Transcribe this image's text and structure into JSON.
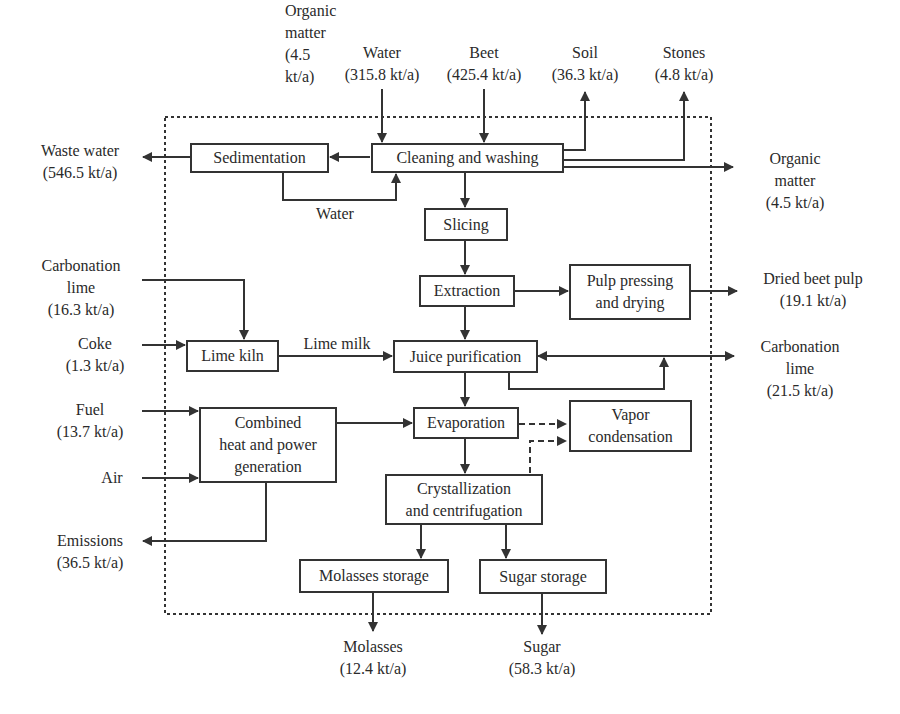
{
  "diagram": {
    "type": "process-flow",
    "boundary": "dotted system boundary",
    "units": {
      "sedimentation": "Sedimentation",
      "cleaning": "Cleaning and washing",
      "slicing": "Slicing",
      "extraction": "Extraction",
      "pulp": "Pulp pressing\nand drying",
      "lime_kiln": "Lime kiln",
      "juice": "Juice purification",
      "chp": "Combined\nheat and power\ngeneration",
      "evaporation": "Evaporation",
      "vapor": "Vapor\ncondensation",
      "crystallization": "Crystallization\nand centrifugation",
      "molasses_storage": "Molasses storage",
      "sugar_storage": "Sugar storage"
    },
    "streams": {
      "water_in": "Water\n(315.8 kt/a)",
      "beet_in": "Beet\n(425.4 kt/a)",
      "soil_out": "Soil\n(36.3 kt/a)",
      "stones_out": "Stones\n(4.8 kt/a)",
      "waste_water_out": "Waste water\n(546.5 kt/a)",
      "organic_out": "Organic\nmatter\n(4.5 kt/a)",
      "water_recycle": "Water",
      "carb_lime_in": "Carbonation\nlime\n(16.3 kt/a)",
      "coke_in": "Coke\n(1.3 kt/a)",
      "lime_milk": "Lime milk",
      "dried_pulp_out": "Dried beet pulp\n(19.1 kt/a)",
      "carb_lime_out": "Carbonation\nlime\n(21.5 kt/a)",
      "fuel_in": "Fuel\n(13.7 kt/a)",
      "air_in": "Air",
      "emissions_out": "Emissions\n(36.5 kt/a)",
      "molasses_out": "Molasses\n(12.4 kt/a)",
      "sugar_out": "Sugar\n(58.3 kt/a)"
    },
    "flows": [
      {
        "from": "Water (315.8 kt/a)",
        "to": "Cleaning and washing"
      },
      {
        "from": "Beet (425.4 kt/a)",
        "to": "Cleaning and washing"
      },
      {
        "from": "Cleaning and washing",
        "to": "Soil (36.3 kt/a)"
      },
      {
        "from": "Cleaning and washing",
        "to": "Stones (4.8 kt/a)"
      },
      {
        "from": "Cleaning and washing",
        "to": "Organic matter (4.5 kt/a)"
      },
      {
        "from": "Cleaning and washing",
        "to": "Sedimentation"
      },
      {
        "from": "Sedimentation",
        "to": "Waste water (546.5 kt/a)"
      },
      {
        "from": "Sedimentation",
        "to": "Cleaning and washing",
        "label": "Water"
      },
      {
        "from": "Cleaning and washing",
        "to": "Slicing"
      },
      {
        "from": "Slicing",
        "to": "Extraction"
      },
      {
        "from": "Extraction",
        "to": "Pulp pressing and drying"
      },
      {
        "from": "Pulp pressing and drying",
        "to": "Dried beet pulp (19.1 kt/a)"
      },
      {
        "from": "Extraction",
        "to": "Juice purification"
      },
      {
        "from": "Carbonation lime (16.3 kt/a)",
        "to": "Lime kiln"
      },
      {
        "from": "Coke (1.3 kt/a)",
        "to": "Lime kiln"
      },
      {
        "from": "Lime kiln",
        "to": "Juice purification",
        "label": "Lime milk"
      },
      {
        "from": "Juice purification",
        "to": "Carbonation lime (21.5 kt/a)"
      },
      {
        "from": "Fuel (13.7 kt/a)",
        "to": "Combined heat and power generation"
      },
      {
        "from": "Air",
        "to": "Combined heat and power generation"
      },
      {
        "from": "Combined heat and power generation",
        "to": "Evaporation"
      },
      {
        "from": "Combined heat and power generation",
        "to": "Emissions (36.5 kt/a)"
      },
      {
        "from": "Juice purification",
        "to": "Evaporation"
      },
      {
        "from": "Evaporation",
        "to": "Vapor condensation",
        "style": "dashed"
      },
      {
        "from": "Crystallization and centrifugation",
        "to": "Vapor condensation",
        "style": "dashed"
      },
      {
        "from": "Evaporation",
        "to": "Crystallization and centrifugation"
      },
      {
        "from": "Crystallization and centrifugation",
        "to": "Molasses storage"
      },
      {
        "from": "Crystallization and centrifugation",
        "to": "Sugar storage"
      },
      {
        "from": "Molasses storage",
        "to": "Molasses (12.4 kt/a)"
      },
      {
        "from": "Sugar storage",
        "to": "Sugar (58.3 kt/a)"
      }
    ]
  }
}
